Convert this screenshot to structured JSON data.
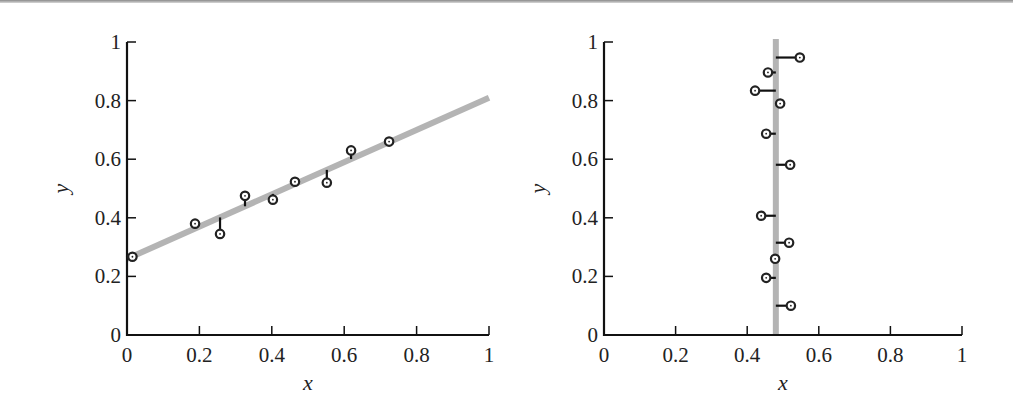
{
  "chart_data": [
    {
      "type": "scatter",
      "title": "",
      "xlabel": "x",
      "ylabel": "y",
      "xlim": [
        0,
        1
      ],
      "ylim": [
        0,
        1
      ],
      "xticks": [
        "0",
        "0.2",
        "0.4",
        "0.6",
        "0.8",
        "1"
      ],
      "yticks": [
        "0",
        "0.2",
        "0.4",
        "0.6",
        "0.8",
        "1"
      ],
      "grid": false,
      "fit_line": {
        "type": "linear",
        "intercept": 0.26,
        "slope": 0.55,
        "color": "#b4b4b4"
      },
      "residuals": "vertical",
      "points": [
        {
          "x": 0.015,
          "y": 0.267
        },
        {
          "x": 0.188,
          "y": 0.38
        },
        {
          "x": 0.257,
          "y": 0.345
        },
        {
          "x": 0.326,
          "y": 0.475
        },
        {
          "x": 0.403,
          "y": 0.462
        },
        {
          "x": 0.464,
          "y": 0.523
        },
        {
          "x": 0.552,
          "y": 0.52
        },
        {
          "x": 0.619,
          "y": 0.63
        },
        {
          "x": 0.724,
          "y": 0.66
        }
      ]
    },
    {
      "type": "scatter",
      "title": "",
      "xlabel": "x",
      "ylabel": "y",
      "xlim": [
        0,
        1
      ],
      "ylim": [
        0,
        1
      ],
      "xticks": [
        "0",
        "0.2",
        "0.4",
        "0.6",
        "0.8",
        "1"
      ],
      "yticks": [
        "0",
        "0.2",
        "0.4",
        "0.6",
        "0.8",
        "1"
      ],
      "grid": false,
      "fit_line": {
        "type": "vertical",
        "x": 0.48,
        "color": "#b4b4b4"
      },
      "residuals": "horizontal",
      "points": [
        {
          "x": 0.547,
          "y": 0.947
        },
        {
          "x": 0.458,
          "y": 0.896
        },
        {
          "x": 0.422,
          "y": 0.834
        },
        {
          "x": 0.492,
          "y": 0.79
        },
        {
          "x": 0.453,
          "y": 0.687
        },
        {
          "x": 0.52,
          "y": 0.581
        },
        {
          "x": 0.439,
          "y": 0.407
        },
        {
          "x": 0.517,
          "y": 0.315
        },
        {
          "x": 0.478,
          "y": 0.26
        },
        {
          "x": 0.453,
          "y": 0.195
        },
        {
          "x": 0.522,
          "y": 0.1
        }
      ]
    }
  ],
  "layout": {
    "charts": [
      {
        "x0": 127,
        "x1": 489,
        "y0": 335,
        "y1": 42,
        "ylabel_x": 68
      },
      {
        "x0": 604,
        "x1": 962,
        "y0": 335,
        "y1": 42,
        "ylabel_x": 545
      }
    ]
  }
}
